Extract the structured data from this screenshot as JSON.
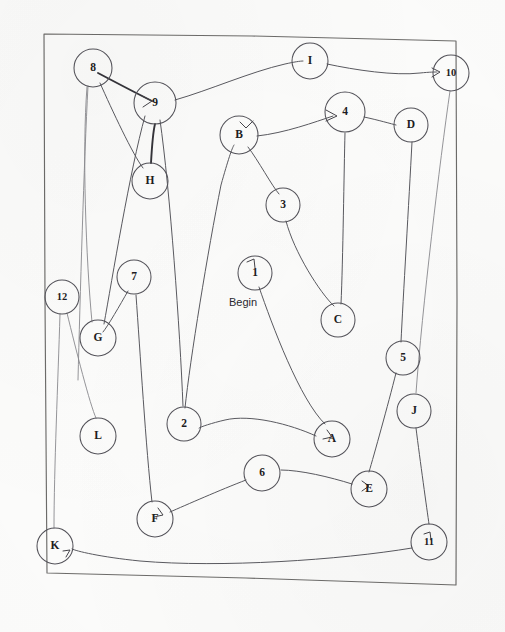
{
  "test": {
    "name": "trail-making-test-part-b",
    "begin_label": "Begin",
    "ink_color": "#54535a",
    "frame_color": "#6d6c6a",
    "paper_color": "#fdfdfc"
  },
  "nodes": [
    {
      "id": "n8",
      "label": "8",
      "cx": 93,
      "cy": 68,
      "r": 19
    },
    {
      "id": "n9",
      "label": "9",
      "cx": 155,
      "cy": 103,
      "r": 21
    },
    {
      "id": "nH",
      "label": "H",
      "cx": 150,
      "cy": 181,
      "r": 18
    },
    {
      "id": "nI",
      "label": "I",
      "cx": 310,
      "cy": 61,
      "r": 18
    },
    {
      "id": "n10",
      "label": "10",
      "cx": 451,
      "cy": 73,
      "r": 18
    },
    {
      "id": "nB",
      "label": "B",
      "cx": 239,
      "cy": 135,
      "r": 19
    },
    {
      "id": "n4",
      "label": "4",
      "cx": 345,
      "cy": 112,
      "r": 20
    },
    {
      "id": "nD",
      "label": "D",
      "cx": 411,
      "cy": 125,
      "r": 17
    },
    {
      "id": "n3",
      "label": "3",
      "cx": 283,
      "cy": 205,
      "r": 17
    },
    {
      "id": "n1",
      "label": "1",
      "cx": 255,
      "cy": 273,
      "r": 17
    },
    {
      "id": "nC",
      "label": "C",
      "cx": 338,
      "cy": 320,
      "r": 17
    },
    {
      "id": "n7",
      "label": "7",
      "cx": 134,
      "cy": 277,
      "r": 17
    },
    {
      "id": "n12",
      "label": "12",
      "cx": 62,
      "cy": 297,
      "r": 17
    },
    {
      "id": "nG",
      "label": "G",
      "cx": 98,
      "cy": 338,
      "r": 18
    },
    {
      "id": "n5",
      "label": "5",
      "cx": 403,
      "cy": 358,
      "r": 17
    },
    {
      "id": "nJ",
      "label": "J",
      "cx": 414,
      "cy": 411,
      "r": 17
    },
    {
      "id": "nL",
      "label": "L",
      "cx": 98,
      "cy": 436,
      "r": 18
    },
    {
      "id": "n2",
      "label": "2",
      "cx": 184,
      "cy": 424,
      "r": 17
    },
    {
      "id": "nA",
      "label": "A",
      "cx": 332,
      "cy": 439,
      "r": 18
    },
    {
      "id": "n6",
      "label": "6",
      "cx": 262,
      "cy": 473,
      "r": 18
    },
    {
      "id": "nE",
      "label": "E",
      "cx": 369,
      "cy": 489,
      "r": 18
    },
    {
      "id": "nF",
      "label": "F",
      "cx": 155,
      "cy": 519,
      "r": 18
    },
    {
      "id": "nK",
      "label": "K",
      "cx": 55,
      "cy": 546,
      "r": 18
    },
    {
      "id": "n11",
      "label": "11",
      "cx": 429,
      "cy": 542,
      "r": 18
    }
  ],
  "begin_marker": {
    "x": 243,
    "y": 303,
    "attached_to": "n1"
  },
  "frame": {
    "path": "M 44 34 L 252 36 L 456 41 L 457 300 L 456 585 L 246 578 L 47 573 L 45 300 Z"
  },
  "trail": {
    "sequence": [
      "1",
      "A",
      "2",
      "B",
      "3",
      "C",
      "4",
      "D",
      "5",
      "E",
      "6",
      "F",
      "7",
      "G",
      "8",
      "H",
      "9",
      "I",
      "10",
      "J",
      "11",
      "K",
      "12",
      "L"
    ],
    "segments": [
      {
        "from": "n1",
        "to": "nA",
        "weight": "normal",
        "d": "M 259 287 C 272 325, 300 400, 325 424"
      },
      {
        "from": "nA",
        "to": "n2",
        "weight": "normal",
        "d": "M 316 436 C 290 424, 250 414, 225 420 C 212 423, 200 427, 199 428"
      },
      {
        "from": "n2",
        "to": "nB",
        "weight": "normal",
        "d": "M 185 408 C 190 360, 208 250, 221 185 C 228 160, 232 148, 234 145"
      },
      {
        "from": "nB",
        "to": "n3",
        "weight": "normal",
        "d": "M 248 147 C 258 160, 272 186, 279 194"
      },
      {
        "from": "n3",
        "to": "nC",
        "weight": "normal",
        "d": "M 286 221 C 294 252, 320 293, 334 306"
      },
      {
        "from": "nC",
        "to": "n4",
        "weight": "normal",
        "d": "M 341 304 C 343 260, 344 170, 345 133"
      },
      {
        "from": "n4",
        "to": "nD",
        "weight": "normal",
        "d": "M 364 117 C 378 120, 392 124, 396 125"
      },
      {
        "from": "nD",
        "to": "n5",
        "weight": "normal",
        "d": "M 412 142 C 409 200, 403 300, 401 342"
      },
      {
        "from": "n5",
        "to": "nE",
        "weight": "normal",
        "d": "M 396 373 C 388 405, 374 455, 369 472"
      },
      {
        "from": "nE",
        "to": "n6",
        "weight": "normal",
        "d": "M 352 484 C 330 477, 300 470, 281 470"
      },
      {
        "from": "n6",
        "to": "nF",
        "weight": "normal",
        "d": "M 246 480 C 220 490, 186 505, 170 512"
      },
      {
        "from": "nF",
        "to": "n7",
        "weight": "normal",
        "d": "M 152 502 C 146 450, 140 350, 136 295"
      },
      {
        "from": "n7",
        "to": "nG",
        "weight": "normal",
        "d": "M 128 291 C 120 305, 108 326, 103 332"
      },
      {
        "from": "nG",
        "to": "n8",
        "weight": "faint",
        "d": "M 92 322 C 86 260, 82 150, 87 87"
      },
      {
        "from": "n8",
        "to": "nH",
        "weight": "normal",
        "d": "M 100 83 C 112 110, 133 155, 143 168"
      },
      {
        "from": "nH",
        "to": "n9",
        "weight": "heavy",
        "d": "M 151 163 C 152 145, 154 128, 155 124"
      },
      {
        "from": "n9",
        "to": "nI",
        "weight": "normal",
        "d": "M 175 100 C 210 90, 250 72, 285 64 C 294 62, 300 61, 303 61"
      },
      {
        "from": "nI",
        "to": "n10",
        "weight": "normal",
        "d": "M 327 64 C 355 70, 395 76, 420 73 C 430 72, 435 72, 437 72"
      },
      {
        "from": "n10",
        "to": "nJ",
        "weight": "faint",
        "d": "M 450 91 C 440 160, 422 310, 416 393"
      },
      {
        "from": "nJ",
        "to": "n11",
        "weight": "normal",
        "d": "M 416 428 C 420 460, 427 510, 429 524"
      },
      {
        "from": "n11",
        "to": "nK",
        "weight": "normal",
        "d": "M 412 548 C 340 560, 220 568, 140 561 C 100 557, 76 551, 72 549"
      },
      {
        "from": "nK",
        "to": "n12",
        "weight": "faint",
        "d": "M 54 528 C 54 470, 58 380, 60 314"
      },
      {
        "from": "n12",
        "to": "nL",
        "weight": "faint",
        "d": "M 67 313 C 76 350, 90 405, 96 418"
      }
    ],
    "extra_marks": [
      {
        "name": "stray-8-to-9-stroke",
        "weight": "heavy",
        "d": "M 98 73 C 115 82, 138 94, 152 101"
      },
      {
        "name": "stray-9-to-G-stroke",
        "weight": "normal",
        "d": "M 145 116 C 130 170, 112 280, 104 324"
      },
      {
        "name": "stray-9-to-2-stroke",
        "weight": "normal",
        "d": "M 160 120 C 170 190, 180 330, 183 406"
      },
      {
        "name": "stray-B-to-4-arrow",
        "weight": "normal",
        "d": "M 257 136 C 285 133, 315 122, 333 116"
      },
      {
        "name": "stray-left-margin-line",
        "weight": "faint",
        "d": "M 88 86 C 84 160, 80 300, 78 380"
      }
    ],
    "arrow_heads": [
      {
        "name": "arrow-into-9",
        "d": "M 142 96 L 152 101 L 143 107"
      },
      {
        "name": "arrow-into-4",
        "d": "M 326 110 L 337 116 L 326 121"
      },
      {
        "name": "arrow-into-1",
        "d": "M 247 262 L 254 259 L 255 268"
      },
      {
        "name": "arrow-into-B",
        "d": "M 253 121 L 246 128 L 240 122"
      },
      {
        "name": "arrow-into-F",
        "d": "M 158 508 L 163 515 L 154 517"
      },
      {
        "name": "arrow-into-K",
        "d": "M 63 551 L 70 550 L 66 557"
      },
      {
        "name": "arrow-into-A",
        "d": "M 327 430 L 332 437 L 323 439"
      },
      {
        "name": "arrow-into-E",
        "d": "M 362 481 L 369 486 L 362 491"
      },
      {
        "name": "arrow-into-11",
        "d": "M 424 534 L 430 532 L 431 540"
      },
      {
        "name": "arrow-into-10",
        "d": "M 432 68 L 440 72 L 432 77"
      }
    ]
  }
}
